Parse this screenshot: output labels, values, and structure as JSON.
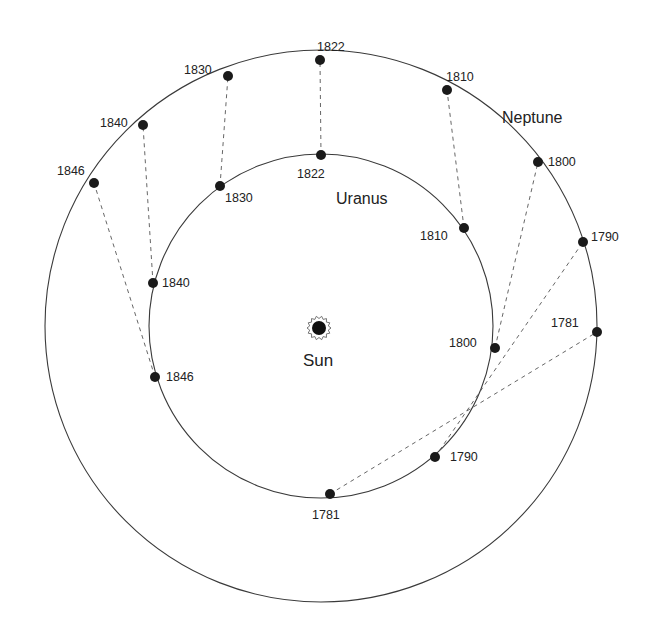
{
  "diagram": {
    "title": "",
    "sun": {
      "label": "Sun",
      "x": 319,
      "y": 328
    },
    "orbits": [
      {
        "name": "Neptune",
        "label": "Neptune",
        "cx": 321,
        "cy": 326,
        "r": 276,
        "label_x": 502,
        "label_y": 123
      },
      {
        "name": "Uranus",
        "label": "Uranus",
        "cx": 321,
        "cy": 326,
        "r": 172,
        "label_x": 336,
        "label_y": 204
      }
    ],
    "neptune_positions": [
      {
        "year": "1781",
        "x": 597,
        "y": 332,
        "label_x": 551,
        "label_y": 327
      },
      {
        "year": "1790",
        "x": 583,
        "y": 242,
        "label_x": 591,
        "label_y": 241
      },
      {
        "year": "1800",
        "x": 538,
        "y": 162,
        "label_x": 548,
        "label_y": 166
      },
      {
        "year": "1810",
        "x": 447,
        "y": 90,
        "label_x": 446,
        "label_y": 81
      },
      {
        "year": "1822",
        "x": 320,
        "y": 60,
        "label_x": 317,
        "label_y": 51
      },
      {
        "year": "1830",
        "x": 228,
        "y": 76,
        "label_x": 184,
        "label_y": 74
      },
      {
        "year": "1840",
        "x": 143,
        "y": 125,
        "label_x": 100,
        "label_y": 127
      },
      {
        "year": "1846",
        "x": 94,
        "y": 183,
        "label_x": 57,
        "label_y": 175
      }
    ],
    "uranus_positions": [
      {
        "year": "1781",
        "x": 330,
        "y": 494,
        "label_x": 312,
        "label_y": 519
      },
      {
        "year": "1790",
        "x": 435,
        "y": 457,
        "label_x": 450,
        "label_y": 461
      },
      {
        "year": "1800",
        "x": 495,
        "y": 348,
        "label_x": 449,
        "label_y": 347
      },
      {
        "year": "1810",
        "x": 464,
        "y": 228,
        "label_x": 420,
        "label_y": 240
      },
      {
        "year": "1822",
        "x": 321,
        "y": 155,
        "label_x": 297,
        "label_y": 178
      },
      {
        "year": "1830",
        "x": 220,
        "y": 186,
        "label_x": 225,
        "label_y": 202
      },
      {
        "year": "1840",
        "x": 153,
        "y": 283,
        "label_x": 162,
        "label_y": 287
      },
      {
        "year": "1846",
        "x": 155,
        "y": 377,
        "label_x": 166,
        "label_y": 381
      }
    ]
  }
}
